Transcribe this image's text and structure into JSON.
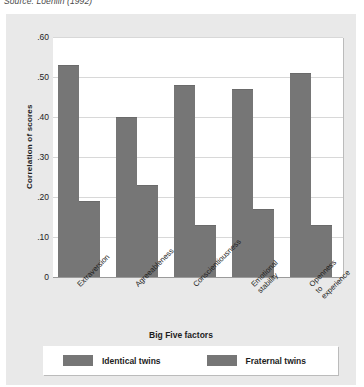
{
  "caption": {
    "source": "Source: Loehlin (1992)"
  },
  "chart_data": {
    "type": "bar",
    "title": "",
    "xlabel": "Big Five factors",
    "ylabel": "Correlation of scores",
    "categories": [
      "Extraversion",
      "Agreeableness",
      "Conscientiousness",
      "Emotional\nstability",
      "Openness\nto\nexperience"
    ],
    "series": [
      {
        "name": "Identical twins",
        "values": [
          0.53,
          0.4,
          0.48,
          0.47,
          0.51
        ],
        "color": "#767676"
      },
      {
        "name": "Fraternal twins",
        "values": [
          0.19,
          0.23,
          0.13,
          0.17,
          0.13
        ],
        "color": "#767676"
      }
    ],
    "ylim": [
      0,
      0.6
    ],
    "ytick_labels": [
      "0",
      ".10",
      ".20",
      ".30",
      ".40",
      ".50",
      ".60"
    ],
    "ytick_values": [
      0,
      0.1,
      0.2,
      0.3,
      0.4,
      0.5,
      0.6
    ],
    "grid": true,
    "legend_position": "bottom"
  }
}
